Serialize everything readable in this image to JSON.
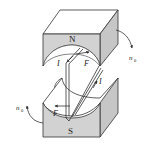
{
  "diagram": {
    "colors": {
      "face": "#d4d4d4",
      "top": "#ffffff",
      "side": "#c8c8c8",
      "line": "#333333"
    },
    "poles": {
      "north": "N",
      "south": "S"
    },
    "labels": {
      "current_top": "I",
      "current_right": "I",
      "force_top": "F",
      "force_bottom": "F",
      "rotation_right": "n",
      "rotation_right_sub": "0",
      "rotation_left": "n",
      "rotation_left_sub": "0"
    }
  }
}
